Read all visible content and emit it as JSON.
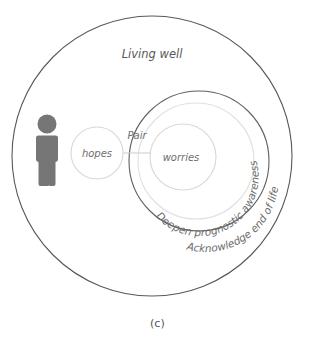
{
  "figure": {
    "caption": "(c)",
    "type": "venn-nested-circle-diagram",
    "background_color": "#ffffff"
  },
  "colors": {
    "outer_stroke": "#595959",
    "medium_stroke": "#5f5f5f",
    "light_stroke": "#d8d8d8",
    "inner_light_stroke": "#e0e0e0",
    "connector_stroke": "#cfcfcf",
    "person_fill": "#767676",
    "text_primary": "#595959",
    "text_secondary": "#6e6e6e"
  },
  "regions": {
    "outer_circle": {
      "label": "Living well",
      "name": "living-well-region",
      "cx": 152,
      "cy": 156,
      "r": 140,
      "stroke": "#595959"
    },
    "medium_circle": {
      "label": "Acknowledge end of life",
      "name": "acknowledge-end-of-life-region",
      "cx": 199,
      "cy": 161,
      "r": 70,
      "stroke": "#5f5f5f"
    },
    "prognostic_circle": {
      "label": "Deepen prognostic awareness",
      "name": "deepen-prognostic-awareness-region",
      "cx": 196,
      "cy": 161,
      "r": 58,
      "stroke": "#e0e0e0"
    },
    "hopes_circle": {
      "label": "hopes",
      "name": "hopes-region",
      "cx": 97,
      "cy": 153,
      "r": 26,
      "stroke": "#d8d8d8"
    },
    "worries_circle": {
      "label": "worries",
      "name": "worries-region",
      "cx": 183,
      "cy": 157,
      "r": 33,
      "stroke": "#d8d8d8"
    }
  },
  "connector": {
    "label": "Pair",
    "name": "pair-connector",
    "x1": 123,
    "y1": 153,
    "x2": 150,
    "y2": 153
  },
  "person": {
    "name": "patient-person-icon",
    "label": "person",
    "cx": 47,
    "cy": 150
  },
  "labels": {
    "living_well": "Living well",
    "pair": "Pair",
    "hopes": "hopes",
    "worries": "worries",
    "deepen_prognostic_awareness": "Deepen prognostic awareness",
    "acknowledge_end_of_life": "Acknowledge end of life",
    "caption": "(c)"
  }
}
